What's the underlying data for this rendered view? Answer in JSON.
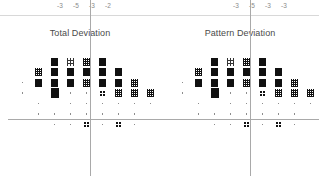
{
  "header": {
    "left_values": [
      "-3",
      "-5",
      "-3",
      "-2"
    ],
    "right_values": [
      "-3",
      "-5",
      "-3",
      "-3"
    ]
  },
  "panels": [
    {
      "key": "total_deviation",
      "title": "Total Deviation"
    },
    {
      "key": "pattern_deviation",
      "title": "Pattern Deviation"
    }
  ],
  "legend_semantics": {
    "solid": "p < 0.5%",
    "hatch_dense": "p < 1%",
    "hatch_medium": "p < 2%",
    "quad_dots": "p < 5%",
    "dot": "within normal limits"
  },
  "chart_data": {
    "type": "heatmap",
    "xlabel": "",
    "ylabel": "",
    "grid": false,
    "legend_position": "none",
    "symbol_scale": [
      "dot",
      "quad",
      "h2",
      "h1",
      "solid"
    ],
    "plots": [
      {
        "name": "Total Deviation",
        "rows": [
          {
            "y": 0,
            "cells": [
              {
                "x": 2,
                "s": "solid"
              },
              {
                "x": 3,
                "s": "h2"
              },
              {
                "x": 4,
                "s": "h1"
              },
              {
                "x": 5,
                "s": "solid"
              }
            ]
          },
          {
            "y": 1,
            "cells": [
              {
                "x": 1,
                "s": "h1"
              },
              {
                "x": 2,
                "s": "solid"
              },
              {
                "x": 3,
                "s": "solid"
              },
              {
                "x": 4,
                "s": "solid"
              },
              {
                "x": 5,
                "s": "solid"
              },
              {
                "x": 6,
                "s": "solid"
              }
            ]
          },
          {
            "y": 2,
            "cells": [
              {
                "x": 0,
                "s": "dot"
              },
              {
                "x": 1,
                "s": "solid"
              },
              {
                "x": 2,
                "s": "solid"
              },
              {
                "x": 3,
                "s": "solid"
              },
              {
                "x": 4,
                "s": "h1"
              },
              {
                "x": 5,
                "s": "solid"
              },
              {
                "x": 6,
                "s": "solid"
              },
              {
                "x": 7,
                "s": "h1"
              }
            ]
          },
          {
            "y": 3,
            "cells": [
              {
                "x": 0,
                "s": "dot"
              },
              {
                "x": 2,
                "s": "big"
              },
              {
                "x": 3,
                "s": "dot"
              },
              {
                "x": 4,
                "s": "dot"
              },
              {
                "x": 5,
                "s": "quad"
              },
              {
                "x": 6,
                "s": "h1"
              },
              {
                "x": 7,
                "s": "h1"
              },
              {
                "x": 8,
                "s": "h1"
              }
            ]
          },
          {
            "y": 4,
            "cells": [
              {
                "x": 1,
                "s": "dot"
              },
              {
                "x": 3,
                "s": "dot"
              },
              {
                "x": 4,
                "s": "dot"
              },
              {
                "x": 5,
                "s": "dot"
              },
              {
                "x": 6,
                "s": "dot"
              },
              {
                "x": 7,
                "s": "dot"
              },
              {
                "x": 8,
                "s": "dot"
              }
            ]
          },
          {
            "y": 5,
            "cells": [
              {
                "x": 1,
                "s": "dot"
              },
              {
                "x": 2,
                "s": "dot"
              },
              {
                "x": 3,
                "s": "dot"
              },
              {
                "x": 4,
                "s": "dot"
              },
              {
                "x": 5,
                "s": "dot"
              },
              {
                "x": 6,
                "s": "dot"
              },
              {
                "x": 7,
                "s": "dot"
              }
            ]
          },
          {
            "y": 6,
            "cells": [
              {
                "x": 2,
                "s": "dot"
              },
              {
                "x": 3,
                "s": "dot"
              },
              {
                "x": 4,
                "s": "quad"
              },
              {
                "x": 5,
                "s": "dot"
              },
              {
                "x": 6,
                "s": "quad"
              },
              {
                "x": 7,
                "s": "dot"
              }
            ]
          }
        ]
      },
      {
        "name": "Pattern Deviation",
        "rows": [
          {
            "y": 0,
            "cells": [
              {
                "x": 2,
                "s": "solid"
              },
              {
                "x": 3,
                "s": "h2"
              },
              {
                "x": 4,
                "s": "h1"
              },
              {
                "x": 5,
                "s": "solid"
              }
            ]
          },
          {
            "y": 1,
            "cells": [
              {
                "x": 1,
                "s": "h1"
              },
              {
                "x": 2,
                "s": "solid"
              },
              {
                "x": 3,
                "s": "solid"
              },
              {
                "x": 4,
                "s": "solid"
              },
              {
                "x": 5,
                "s": "solid"
              },
              {
                "x": 6,
                "s": "solid"
              }
            ]
          },
          {
            "y": 2,
            "cells": [
              {
                "x": 0,
                "s": "dot"
              },
              {
                "x": 1,
                "s": "solid"
              },
              {
                "x": 2,
                "s": "solid"
              },
              {
                "x": 3,
                "s": "solid"
              },
              {
                "x": 4,
                "s": "h1"
              },
              {
                "x": 5,
                "s": "solid"
              },
              {
                "x": 6,
                "s": "solid"
              },
              {
                "x": 7,
                "s": "h1"
              }
            ]
          },
          {
            "y": 3,
            "cells": [
              {
                "x": 0,
                "s": "dot"
              },
              {
                "x": 2,
                "s": "big"
              },
              {
                "x": 3,
                "s": "dot"
              },
              {
                "x": 4,
                "s": "dot"
              },
              {
                "x": 5,
                "s": "quad"
              },
              {
                "x": 6,
                "s": "h1"
              },
              {
                "x": 7,
                "s": "h1"
              },
              {
                "x": 8,
                "s": "h1"
              }
            ]
          },
          {
            "y": 4,
            "cells": [
              {
                "x": 1,
                "s": "dot"
              },
              {
                "x": 3,
                "s": "dot"
              },
              {
                "x": 4,
                "s": "dot"
              },
              {
                "x": 5,
                "s": "dot"
              },
              {
                "x": 6,
                "s": "dot"
              },
              {
                "x": 7,
                "s": "dot"
              },
              {
                "x": 8,
                "s": "dot"
              }
            ]
          },
          {
            "y": 5,
            "cells": [
              {
                "x": 1,
                "s": "dot"
              },
              {
                "x": 2,
                "s": "dot"
              },
              {
                "x": 3,
                "s": "dot"
              },
              {
                "x": 4,
                "s": "dot"
              },
              {
                "x": 5,
                "s": "dot"
              },
              {
                "x": 6,
                "s": "dot"
              },
              {
                "x": 7,
                "s": "dot"
              }
            ]
          },
          {
            "y": 6,
            "cells": [
              {
                "x": 2,
                "s": "dot"
              },
              {
                "x": 3,
                "s": "dot"
              },
              {
                "x": 4,
                "s": "quad"
              },
              {
                "x": 5,
                "s": "dot"
              },
              {
                "x": 6,
                "s": "quad"
              },
              {
                "x": 7,
                "s": "dot"
              }
            ]
          }
        ]
      }
    ]
  }
}
